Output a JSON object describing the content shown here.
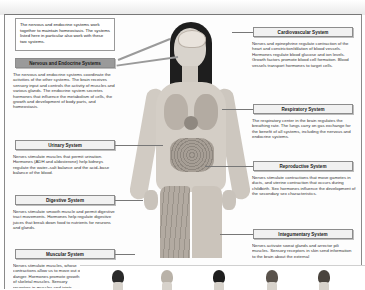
{
  "intro_box": {
    "text": "The nervous and endocrine systems work together to maintain homeostasis. The systems listed here in particular also work with these two systems."
  },
  "left_panels": [
    {
      "title": "Nervous and Endocrine Systems",
      "body": "The nervous and endocrine systems coordinate the activities of the other systems. The brain receives sensory input and controls the activity of muscles and various glands. The endocrine system secretes hormones that influence the metabolism of cells, the growth and development of body parts, and homeostasis."
    },
    {
      "title": "Urinary System",
      "body": "Nerves stimulate muscles that permit urination. Hormones (ADH and aldosterone) help kidneys regulate the water–salt balance and the acid–base balance of the blood."
    },
    {
      "title": "Digestive System",
      "body": "Nerves stimulate smooth muscle and permit digestive tract movements. Hormones help regulate digestive juices that break down food to nutrients for neurons and glands."
    },
    {
      "title": "Muscular System",
      "body": "Nerves stimulate muscles, whose contractions allow us to move out of danger. Hormones promote growth of skeletal muscles. Sensory receptors in muscles and joints"
    }
  ],
  "right_panels": [
    {
      "title": "Cardiovascular System",
      "body": "Nerves and epinephrine regulate contraction of the heart and constriction/dilation of blood vessels. Hormones regulate blood glucose and ion levels. Growth factors promote blood cell formation. Blood vessels transport hormones to target cells."
    },
    {
      "title": "Respiratory System",
      "body": "The respiratory center in the brain regulates the breathing rate. The lungs carry on gas exchange for the benefit of all systems, including the nervous and endocrine systems."
    },
    {
      "title": "Reproductive System",
      "body": "Nerves stimulate contractions that move gametes in ducts, and uterine contraction that occurs during childbirth. Sex hormones influence the development of the secondary sex characteristics."
    },
    {
      "title": "Integumentary System",
      "body": "Nerves activate sweat glands and arrector pili muscles. Sensory receptors in skin send information to the brain about the external"
    }
  ],
  "figure": {
    "bottom_strip_faces": [
      "dark-haired woman front",
      "light-haired person front",
      "dark-haired woman profile",
      "dark-haired man three-quarter",
      "dark-haired man profile"
    ]
  },
  "colors": {
    "dark_header": "#9a9a9a",
    "light_header": "#f1f1f1",
    "border": "#8c8c8c"
  }
}
